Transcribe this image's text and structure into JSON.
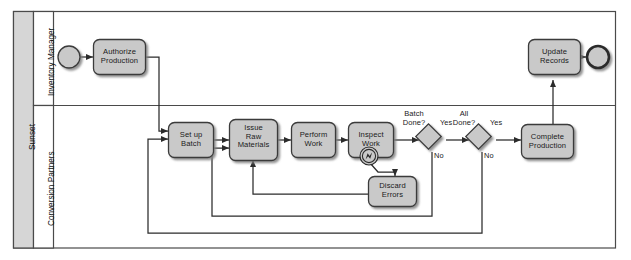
{
  "diagram": {
    "type": "bpmn-process-diagram",
    "pool": {
      "name": "Sunset"
    },
    "lanes": [
      {
        "id": "inventory-manager",
        "name": "Inventory Manager"
      },
      {
        "id": "conversion-partners",
        "name": "Conversion Partners"
      }
    ],
    "events": [
      {
        "id": "start",
        "kind": "start-event",
        "label": ""
      },
      {
        "id": "end",
        "kind": "end-event",
        "label": ""
      },
      {
        "id": "error-boundary",
        "kind": "error-boundary-event",
        "label": ""
      }
    ],
    "tasks": [
      {
        "id": "authorize-production",
        "label": "Authorize\nProduction",
        "line1": "Authorize",
        "line2": "Production",
        "lane": "inventory-manager"
      },
      {
        "id": "update-records",
        "label": "Update\nRecords",
        "line1": "Update",
        "line2": "Records",
        "lane": "inventory-manager"
      },
      {
        "id": "set-up-batch",
        "label": "Set up\nBatch",
        "line1": "Set up",
        "line2": "Batch",
        "lane": "conversion-partners"
      },
      {
        "id": "issue-raw-materials",
        "label": "Issue\nRaw\nMaterials",
        "line1": "Issue",
        "line2": "Raw",
        "line3": "Materials",
        "lane": "conversion-partners"
      },
      {
        "id": "perform-work",
        "label": "Perform\nWork",
        "line1": "Perform",
        "line2": "Work",
        "lane": "conversion-partners"
      },
      {
        "id": "inspect-work",
        "label": "Inspect\nWork",
        "line1": "Inspect",
        "line2": "Work",
        "lane": "conversion-partners"
      },
      {
        "id": "discard-errors",
        "label": "Discard\nErrors",
        "line1": "Discard",
        "line2": "Errors",
        "lane": "conversion-partners"
      },
      {
        "id": "complete-production",
        "label": "Complete\nProduction",
        "line1": "Complete",
        "line2": "Production",
        "lane": "conversion-partners"
      }
    ],
    "gateways": [
      {
        "id": "batch-done",
        "kind": "exclusive-gateway",
        "line1": "Batch",
        "line2": "Done?"
      },
      {
        "id": "all-done",
        "kind": "exclusive-gateway",
        "line1": "All",
        "line2": "Done?"
      }
    ],
    "flow_labels": {
      "batch_done_yes": "Yes",
      "batch_done_no": "No",
      "all_done_yes": "Yes",
      "all_done_no": "No"
    },
    "colors": {
      "shape_fill": "#c9c9c9",
      "shape_stroke": "#3a3a3a",
      "lane_band_fill": "#d6d6d6",
      "pool_band_fill": "#d6d6d6",
      "canvas": "#ffffff",
      "flow_stroke": "#2b2b2b",
      "text": "#1a1a1a"
    }
  }
}
